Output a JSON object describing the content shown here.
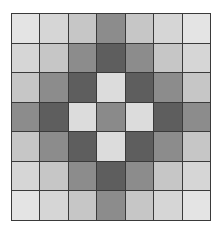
{
  "grid": {
    "rows": 7,
    "cols": 7,
    "palette_by_distance": [
      "#8a8a8a",
      "#dcdcdc",
      "#5e5e5e",
      "#8c8c8c",
      "#c6c6c6",
      "#d6d6d6",
      "#e4e4e4"
    ],
    "cells": [
      [
        6,
        5,
        4,
        3,
        4,
        5,
        6
      ],
      [
        5,
        4,
        3,
        2,
        3,
        4,
        5
      ],
      [
        4,
        3,
        2,
        1,
        2,
        3,
        4
      ],
      [
        3,
        2,
        1,
        0,
        1,
        2,
        3
      ],
      [
        4,
        3,
        2,
        1,
        2,
        3,
        4
      ],
      [
        5,
        4,
        3,
        2,
        3,
        4,
        5
      ],
      [
        6,
        5,
        4,
        3,
        4,
        5,
        6
      ]
    ]
  }
}
